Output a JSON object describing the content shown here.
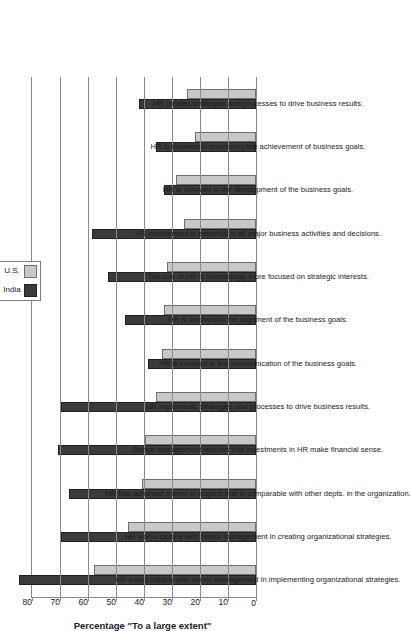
{
  "chart_data": {
    "type": "bar",
    "title": "",
    "xlabel": "",
    "ylabel": "Percentage \"To a large extent\"",
    "ylim": [
      0,
      80
    ],
    "ytick_step": 10,
    "yticks": [
      "0",
      "10",
      "20",
      "30",
      "40",
      "50",
      "60",
      "70",
      "80"
    ],
    "grid": true,
    "orientation": "vertical-rotated-90ccw",
    "legend_position": "top-right",
    "categories": [
      "HR works closely with senior management in implementing organizational strategies.",
      "HR works closely with senior management in creating organizational strategies.",
      "HR has achieved a level of respect that is comparable with other depts. in the organization.",
      "Senior management realizes that investments in HR make financial sense.",
      "HR implements strategies and processes to drive business results.",
      "HR is involved in the communication of the business goals.",
      "HR is involved in the alignment of the business goals.",
      "The role of HR is increasingly more focused on strategic interests.",
      "HR involvement is essential in all major business activities and decisions.",
      "HR is involved in the development of the business goals.",
      "HR is involved in monitoring the achievement of business goals.",
      "HR creates strategies and processes to drive business results."
    ],
    "series": [
      {
        "name": "India",
        "color": "#3b3b3b",
        "values": [
          84,
          69,
          66,
          70,
          69,
          38,
          46,
          52,
          58,
          32,
          35,
          41
        ]
      },
      {
        "name": "U.S.",
        "color": "#c8c8c8",
        "values": [
          57,
          45,
          40,
          39,
          35,
          33,
          32,
          31,
          25,
          28,
          21,
          24
        ]
      }
    ]
  },
  "legend": {
    "entries": [
      {
        "label": "India",
        "swatch": "legend-swatch-india"
      },
      {
        "label": "U.S.",
        "swatch": "legend-swatch-us"
      }
    ]
  }
}
